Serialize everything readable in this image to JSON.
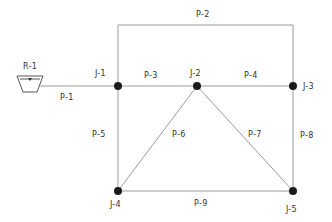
{
  "diagram": {
    "type": "pipe-network",
    "reservoir": {
      "id": "R-1",
      "label": "R-1",
      "x": 30,
      "y": 86
    },
    "junctions": [
      {
        "id": "J-1",
        "label": "J-1",
        "x": 118,
        "y": 86
      },
      {
        "id": "J-2",
        "label": "J-2",
        "x": 197,
        "y": 86
      },
      {
        "id": "J-3",
        "label": "J-3",
        "x": 293,
        "y": 86
      },
      {
        "id": "J-4",
        "label": "J-4",
        "x": 118,
        "y": 191
      },
      {
        "id": "J-5",
        "label": "J-5",
        "x": 293,
        "y": 191
      }
    ],
    "pipes": [
      {
        "id": "P-1",
        "label": "P-1",
        "from": "R-1",
        "to": "J-1"
      },
      {
        "id": "P-2",
        "label": "P-2",
        "from": "J-1",
        "to": "J-3",
        "route": "top loop"
      },
      {
        "id": "P-3",
        "label": "P-3",
        "from": "J-1",
        "to": "J-2"
      },
      {
        "id": "P-4",
        "label": "P-4",
        "from": "J-2",
        "to": "J-3"
      },
      {
        "id": "P-5",
        "label": "P-5",
        "from": "J-1",
        "to": "J-4"
      },
      {
        "id": "P-6",
        "label": "P-6",
        "from": "J-2",
        "to": "J-4"
      },
      {
        "id": "P-7",
        "label": "P-7",
        "from": "J-2",
        "to": "J-5"
      },
      {
        "id": "P-8",
        "label": "P-8",
        "from": "J-3",
        "to": "J-5"
      },
      {
        "id": "P-9",
        "label": "P-9",
        "from": "J-4",
        "to": "J-5"
      }
    ],
    "colors": {
      "pipe": "#9a9a9a",
      "node": "#1a1a1a",
      "text": "#333333"
    }
  }
}
